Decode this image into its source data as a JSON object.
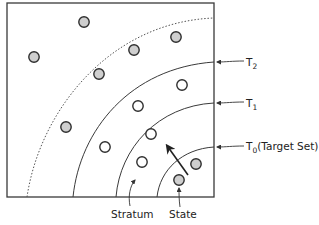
{
  "diagram": {
    "colors": {
      "stroke": "#3a3a3a",
      "state_fill_gray": "#cfcfcf",
      "state_fill_white": "#ffffff",
      "background": "#ffffff"
    },
    "frame": {
      "x": 7,
      "y": 3,
      "width": 207,
      "height": 194
    },
    "boundaries": [
      {
        "id": "T0",
        "label": "T",
        "subscript": "0",
        "suffix": "(Target Set)",
        "style": "solid",
        "bottom_x": 157,
        "right_y": 147
      },
      {
        "id": "T1",
        "label": "T",
        "subscript": "1",
        "suffix": "",
        "style": "solid",
        "bottom_x": 116,
        "right_y": 103
      },
      {
        "id": "T2",
        "label": "T",
        "subscript": "2",
        "suffix": "",
        "style": "solid",
        "bottom_x": 73,
        "right_y": 62
      },
      {
        "id": "outer",
        "label": "",
        "subscript": "",
        "suffix": "",
        "style": "dotted",
        "bottom_x": 27,
        "right_y": 18
      }
    ],
    "states": [
      {
        "cx": 84,
        "cy": 22,
        "filled": true
      },
      {
        "cx": 34,
        "cy": 57,
        "filled": true
      },
      {
        "cx": 134,
        "cy": 50,
        "filled": true
      },
      {
        "cx": 176,
        "cy": 37,
        "filled": true
      },
      {
        "cx": 99,
        "cy": 74,
        "filled": true
      },
      {
        "cx": 182,
        "cy": 85,
        "filled": false
      },
      {
        "cx": 138,
        "cy": 106,
        "filled": false
      },
      {
        "cx": 66,
        "cy": 127,
        "filled": true
      },
      {
        "cx": 105,
        "cy": 147,
        "filled": false
      },
      {
        "cx": 151,
        "cy": 134,
        "filled": false
      },
      {
        "cx": 142,
        "cy": 162,
        "filled": false
      },
      {
        "cx": 196,
        "cy": 164,
        "filled": true
      },
      {
        "cx": 179,
        "cy": 180,
        "filled": true
      }
    ],
    "labels": {
      "t2": {
        "main": "T",
        "sub": "2"
      },
      "t1": {
        "main": "T",
        "sub": "1"
      },
      "t0": {
        "main": "T",
        "sub": "0",
        "suffix": "(Target Set)"
      },
      "stratum": "Stratum",
      "state": "State"
    },
    "arrow": {
      "from": [
        188,
        175
      ],
      "to": [
        167,
        146
      ],
      "meaning": "direction toward outer strata"
    }
  }
}
